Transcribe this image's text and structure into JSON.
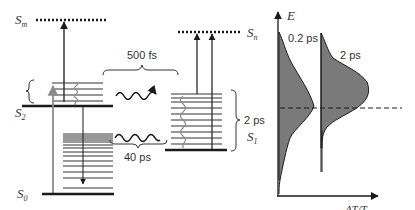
{
  "diagram": {
    "states": {
      "sm": {
        "label": "S",
        "sub": "m"
      },
      "s2": {
        "label": "S",
        "sub": "2"
      },
      "s0": {
        "label": "S",
        "sub": "0"
      },
      "sn": {
        "label": "S",
        "sub": "n"
      },
      "s1": {
        "label": "S",
        "sub": "1"
      }
    },
    "timescales": {
      "ic_s2_s1": "500 fs",
      "s1_s0": "40 ps",
      "s1_vib_relax": "2 ps"
    },
    "spectra": {
      "y_axis_label": "E",
      "x_axis_label": "ΔT/T",
      "curve1_label": "0.2 ps",
      "curve2_label": "2 ps"
    },
    "colors": {
      "line": "#1a1a1a",
      "gray_line": "#8a8a8a",
      "fill": "#7a7a7a"
    }
  }
}
